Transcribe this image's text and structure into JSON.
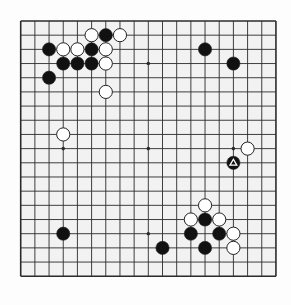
{
  "board": {
    "size": 19,
    "origin_x": 20.7,
    "origin_y": 21,
    "spacing": 14.18,
    "stone_radius": 6.6,
    "colors": {
      "background": "#fdfdfd",
      "board_fill": "#f2f2f2",
      "grid_line": "#2a2a2a",
      "black_stone": "#111111",
      "white_stone": "#ffffff",
      "stone_outline": "#222222",
      "marker_on_black": "#ffffff"
    },
    "star_points": [
      [
        3,
        3
      ],
      [
        9,
        3
      ],
      [
        15,
        3
      ],
      [
        3,
        9
      ],
      [
        9,
        9
      ],
      [
        15,
        9
      ],
      [
        3,
        15
      ],
      [
        9,
        15
      ],
      [
        15,
        15
      ]
    ],
    "stones": [
      {
        "color": "white",
        "col": 5,
        "row": 1
      },
      {
        "color": "black",
        "col": 6,
        "row": 1
      },
      {
        "color": "white",
        "col": 7,
        "row": 1
      },
      {
        "color": "black",
        "col": 2,
        "row": 2
      },
      {
        "color": "white",
        "col": 3,
        "row": 2
      },
      {
        "color": "white",
        "col": 4,
        "row": 2
      },
      {
        "color": "black",
        "col": 5,
        "row": 2
      },
      {
        "color": "white",
        "col": 6,
        "row": 2
      },
      {
        "color": "black",
        "col": 13,
        "row": 2
      },
      {
        "color": "black",
        "col": 3,
        "row": 3
      },
      {
        "color": "black",
        "col": 4,
        "row": 3
      },
      {
        "color": "black",
        "col": 5,
        "row": 3
      },
      {
        "color": "white",
        "col": 6,
        "row": 3
      },
      {
        "color": "black",
        "col": 15,
        "row": 3
      },
      {
        "color": "black",
        "col": 2,
        "row": 4
      },
      {
        "color": "white",
        "col": 6,
        "row": 5
      },
      {
        "color": "white",
        "col": 3,
        "row": 8
      },
      {
        "color": "white",
        "col": 16,
        "row": 9
      },
      {
        "color": "black",
        "col": 15,
        "row": 10,
        "marker": "triangle"
      },
      {
        "color": "white",
        "col": 13,
        "row": 13
      },
      {
        "color": "white",
        "col": 12,
        "row": 14
      },
      {
        "color": "black",
        "col": 13,
        "row": 14
      },
      {
        "color": "white",
        "col": 14,
        "row": 14
      },
      {
        "color": "black",
        "col": 3,
        "row": 15
      },
      {
        "color": "black",
        "col": 12,
        "row": 15
      },
      {
        "color": "black",
        "col": 14,
        "row": 15
      },
      {
        "color": "white",
        "col": 15,
        "row": 15
      },
      {
        "color": "black",
        "col": 10,
        "row": 16
      },
      {
        "color": "black",
        "col": 13,
        "row": 16
      },
      {
        "color": "white",
        "col": 15,
        "row": 16
      }
    ],
    "last_move_marker": {
      "shape": "triangle-icon",
      "col": 15,
      "row": 10
    }
  }
}
